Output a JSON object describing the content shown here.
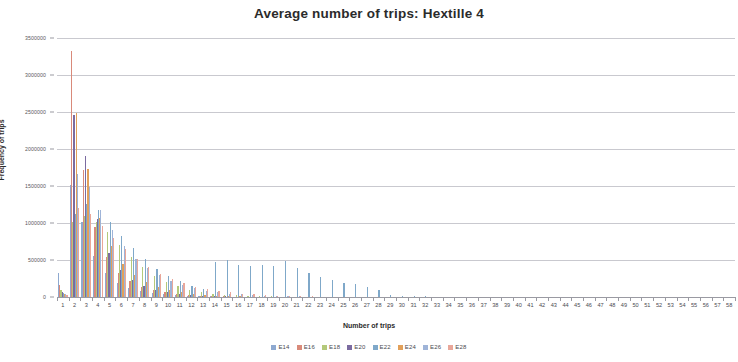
{
  "chart_data": {
    "type": "bar",
    "title": "Average number of trips: Hextille 4",
    "xlabel": "Number of trips",
    "ylabel": "Frequency of trips",
    "ylim": [
      0,
      3500000
    ],
    "ytick_step": 500000,
    "ytick_labels": [
      "0",
      "500000",
      "1000000",
      "1500000",
      "2000000",
      "2500000",
      "3000000",
      "3500000"
    ],
    "grid": true,
    "legend_position": "bottom",
    "categories": [
      1,
      2,
      3,
      4,
      5,
      6,
      7,
      8,
      9,
      10,
      11,
      12,
      13,
      14,
      15,
      16,
      17,
      18,
      19,
      20,
      21,
      22,
      23,
      24,
      25,
      26,
      27,
      28,
      29,
      30,
      31,
      32,
      33,
      34,
      35,
      36,
      37,
      38,
      39,
      40,
      41,
      42,
      43,
      44,
      45,
      46,
      47,
      48,
      49,
      50,
      51,
      52,
      53,
      54,
      55,
      56,
      57,
      58
    ],
    "xtick_labels": [
      "1",
      "2",
      "3",
      "4",
      "5",
      "6",
      "7",
      "8",
      "9",
      "10",
      "11",
      "12",
      "13",
      "14",
      "15",
      "16",
      "17",
      "18",
      "19",
      "20",
      "21",
      "22",
      "23",
      "24",
      "25",
      "26",
      "27",
      "28",
      "29",
      "30",
      "31",
      "32",
      "33",
      "34",
      "35",
      "36",
      "37",
      "38",
      "39",
      "40",
      "41",
      "42",
      "43",
      "44",
      "45",
      "46",
      "47",
      "48",
      "49",
      "50",
      "51",
      "52",
      "53",
      "54",
      "55",
      "56",
      "57",
      "58"
    ],
    "series": [
      {
        "name": "E14",
        "color": "#8ea9d0",
        "values": [
          330000,
          1520000,
          1010000,
          560000,
          320000,
          190000,
          120000,
          80000,
          52000,
          34000,
          22000,
          15000,
          10000,
          7000,
          5000,
          3500,
          2500,
          1800,
          1200,
          900,
          600,
          400,
          300,
          200,
          150,
          100,
          80,
          60,
          40,
          30,
          20,
          15,
          10,
          8,
          6,
          5,
          4,
          3,
          2,
          2,
          1,
          1,
          1,
          0,
          0,
          0,
          0,
          0,
          0,
          0,
          0,
          0,
          0,
          0,
          0,
          0,
          0,
          0
        ]
      },
      {
        "name": "E16",
        "color": "#d98a7a",
        "values": [
          160000,
          3320000,
          1720000,
          950000,
          540000,
          330000,
          210000,
          140000,
          95000,
          62000,
          41000,
          27000,
          18000,
          12000,
          8000,
          5500,
          3800,
          2600,
          1800,
          1300,
          900,
          650,
          450,
          320,
          220,
          160,
          110,
          80,
          55,
          40,
          28,
          20,
          14,
          10,
          7,
          5,
          4,
          3,
          2,
          2,
          1,
          1,
          1,
          0,
          0,
          0,
          0,
          0,
          0,
          0,
          0,
          0,
          0,
          0,
          0,
          0,
          0,
          0
        ]
      },
      {
        "name": "E18",
        "color": "#b4c97a",
        "values": [
          90000,
          1010000,
          1100000,
          1010000,
          880000,
          700000,
          540000,
          400000,
          290000,
          205000,
          143000,
          99000,
          68000,
          47000,
          32000,
          22000,
          15000,
          10500,
          7200,
          5000,
          3400,
          2400,
          1650,
          1150,
          790,
          550,
          380,
          260,
          180,
          125,
          86,
          60,
          41,
          28,
          20,
          14,
          9,
          6,
          4,
          3,
          2,
          2,
          1,
          1,
          0,
          0,
          0,
          0,
          0,
          0,
          0,
          0,
          0,
          0,
          0,
          0,
          0,
          0
        ]
      },
      {
        "name": "E20",
        "color": "#7b6ba0",
        "values": [
          70000,
          2460000,
          1900000,
          1060000,
          600000,
          370000,
          235000,
          152000,
          100000,
          66000,
          44000,
          29000,
          19500,
          13000,
          8700,
          5900,
          4000,
          2700,
          1850,
          1250,
          860,
          590,
          400,
          275,
          190,
          130,
          90,
          62,
          42,
          29,
          20,
          14,
          10,
          7,
          5,
          3,
          2,
          2,
          1,
          1,
          1,
          0,
          0,
          0,
          0,
          0,
          0,
          0,
          0,
          0,
          0,
          0,
          0,
          0,
          0,
          0,
          0,
          0
        ]
      },
      {
        "name": "E22",
        "color": "#7fa8c9",
        "values": [
          55000,
          1120000,
          1260000,
          1170000,
          1010000,
          830000,
          660000,
          510000,
          385000,
          287000,
          210000,
          152000,
          109000,
          478000,
          495000,
          430000,
          420000,
          430000,
          425000,
          480000,
          390000,
          330000,
          265000,
          230000,
          185000,
          170000,
          130000,
          95000,
          30000,
          20000,
          14000,
          9000,
          6000,
          4000,
          2500,
          1600,
          1000,
          650,
          400,
          260,
          160,
          100,
          65,
          40,
          25,
          16,
          10,
          6,
          4,
          2,
          2,
          1,
          1,
          0,
          0,
          0,
          0,
          0
        ]
      },
      {
        "name": "E24",
        "color": "#e2a05a",
        "values": [
          45000,
          2480000,
          1730000,
          1070000,
          690000,
          445000,
          295000,
          198000,
          134000,
          91000,
          62000,
          42000,
          29000,
          19500,
          13200,
          8900,
          6000,
          4100,
          2750,
          1850,
          1250,
          840,
          570,
          385,
          260,
          175,
          118,
          80,
          54,
          36,
          24,
          16,
          11,
          7,
          5,
          3,
          2,
          2,
          1,
          1,
          1,
          0,
          0,
          0,
          0,
          0,
          0,
          0,
          0,
          0,
          0,
          0,
          0,
          0,
          0,
          0,
          0,
          0
        ]
      },
      {
        "name": "E26",
        "color": "#9fb4d8",
        "values": [
          38000,
          1660000,
          1480000,
          1180000,
          905000,
          690000,
          520000,
          390000,
          291000,
          216000,
          160000,
          118000,
          87000,
          64000,
          47000,
          34500,
          25000,
          18500,
          13500,
          9900,
          7200,
          5300,
          3900,
          2850,
          2080,
          1520,
          1110,
          810,
          590,
          430,
          310,
          230,
          165,
          120,
          88,
          64,
          46,
          34,
          24,
          18,
          13,
          9,
          7,
          5,
          3,
          2,
          2,
          1,
          1,
          1,
          0,
          0,
          0,
          0,
          0,
          0,
          0,
          0
        ]
      },
      {
        "name": "E28",
        "color": "#e9a79a",
        "values": [
          30000,
          1200000,
          1120000,
          960000,
          795000,
          645000,
          515000,
          405000,
          315000,
          243000,
          186000,
          142000,
          108000,
          82000,
          62000,
          46500,
          35000,
          26200,
          19600,
          14600,
          10900,
          8100,
          6000,
          4500,
          3350,
          2480,
          1840,
          1370,
          1010,
          750,
          555,
          410,
          305,
          225,
          167,
          123,
          91,
          67,
          50,
          37,
          27,
          20,
          15,
          11,
          8,
          6,
          4,
          3,
          2,
          2,
          1,
          1,
          1,
          0,
          0,
          0,
          0,
          0
        ]
      }
    ]
  }
}
